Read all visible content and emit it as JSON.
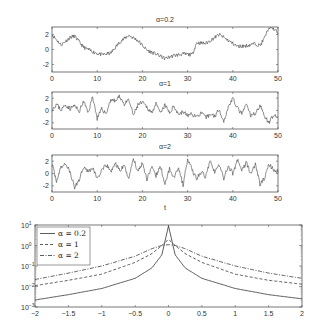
{
  "chart_data": [
    {
      "type": "line",
      "title": "α=0.2",
      "xlabel": "",
      "ylabel": "",
      "xlim": [
        0,
        50
      ],
      "ylim": [
        -3,
        3
      ],
      "xticks": [
        "0",
        "10",
        "20",
        "30",
        "40",
        "50"
      ],
      "yticks": [
        "2",
        "0",
        "-2"
      ],
      "x": [
        0,
        2,
        4,
        5,
        7,
        9,
        11,
        13,
        15,
        17,
        19,
        21,
        23,
        25,
        27,
        29,
        31,
        32,
        34,
        37,
        39,
        41,
        43,
        45,
        46,
        47,
        48,
        49,
        50
      ],
      "values": [
        2.0,
        0.6,
        1.6,
        1.8,
        0.3,
        -0.3,
        -0.7,
        -0.5,
        1.0,
        1.9,
        1.2,
        -0.1,
        -0.6,
        -1.2,
        -0.8,
        -0.6,
        -0.7,
        0.9,
        0.8,
        2.0,
        1.2,
        0.4,
        0.5,
        0.8,
        0.5,
        1.5,
        3.0,
        2.8,
        2.2
      ]
    },
    {
      "type": "line",
      "title": "α=1",
      "xlim": [
        0,
        50
      ],
      "ylim": [
        -3,
        3
      ],
      "xticks": [
        "0",
        "10",
        "20",
        "30",
        "40",
        "50"
      ],
      "yticks": [
        "2",
        "0",
        "-2"
      ],
      "x": [
        0,
        1,
        2,
        3,
        4,
        5,
        6,
        7,
        8,
        9,
        10,
        11,
        12,
        13,
        14,
        15,
        16,
        17,
        18,
        19,
        20,
        21,
        22,
        23,
        24,
        25,
        26,
        27,
        28,
        29,
        30,
        31,
        32,
        33,
        34,
        35,
        36,
        37,
        38,
        39,
        40,
        41,
        42,
        43,
        44,
        45,
        46,
        47,
        48,
        49,
        50
      ],
      "values": [
        0.2,
        1.0,
        0.1,
        0.9,
        0.3,
        0.8,
        -0.2,
        1.5,
        -0.4,
        2.3,
        -1.3,
        0.2,
        -0.5,
        1.8,
        1.5,
        2.3,
        1.0,
        1.7,
        -0.8,
        0.9,
        1.3,
        0.5,
        -0.3,
        1.0,
        -0.5,
        0.9,
        -0.4,
        0.7,
        -0.6,
        -0.2,
        -0.8,
        -0.6,
        -1.0,
        -0.4,
        -1.2,
        -0.6,
        -0.9,
        0.2,
        -1.8,
        0.6,
        2.0,
        0.4,
        -0.6,
        1.0,
        -0.9,
        -0.4,
        0.8,
        -0.8,
        -2.0,
        -0.6,
        -1.5
      ]
    },
    {
      "type": "line",
      "title": "α=2",
      "xlabel": "t",
      "xlim": [
        0,
        50
      ],
      "ylim": [
        -3,
        3
      ],
      "xticks": [
        "0",
        "10",
        "20",
        "30",
        "40",
        "50"
      ],
      "yticks": [
        "2",
        "0",
        "-2"
      ],
      "x": [
        0,
        1,
        2,
        3,
        4,
        5,
        6,
        7,
        8,
        9,
        10,
        11,
        12,
        13,
        14,
        15,
        16,
        17,
        18,
        19,
        20,
        21,
        22,
        23,
        24,
        25,
        26,
        27,
        28,
        29,
        30,
        31,
        32,
        33,
        34,
        35,
        36,
        37,
        38,
        39,
        40,
        41,
        42,
        43,
        44,
        45,
        46,
        47,
        48,
        49,
        50
      ],
      "values": [
        1.5,
        -1.2,
        1.0,
        1.6,
        0.2,
        -2.3,
        -1.0,
        1.2,
        0.3,
        0.9,
        -0.8,
        0.4,
        1.4,
        0.3,
        1.6,
        0.5,
        1.2,
        -0.8,
        2.5,
        0.3,
        1.8,
        -0.9,
        1.0,
        -0.4,
        1.2,
        -1.8,
        0.8,
        -0.6,
        1.0,
        -1.9,
        2.3,
        0.6,
        -0.9,
        0.3,
        -0.6,
        2.3,
        0.2,
        1.4,
        -0.8,
        1.2,
        0.0,
        2.2,
        0.5,
        1.8,
        -0.1,
        1.6,
        -1.8,
        -0.8,
        1.5,
        0.6,
        0.3
      ]
    },
    {
      "type": "line",
      "title": "",
      "xlabel": "",
      "ylabel": "",
      "yscale": "log",
      "xlim": [
        -2,
        2
      ],
      "ylim": [
        0.001,
        10
      ],
      "xticks": [
        "-2",
        "-1.5",
        "-1",
        "-0.5",
        "0",
        "0.5",
        "1",
        "1.5",
        "2"
      ],
      "yticks": [
        "10^1",
        "10^0",
        "10^-1",
        "10^-2",
        "10^-3"
      ],
      "legend_position": "upper left",
      "x": [
        -2,
        -1.5,
        -1,
        -0.5,
        -0.25,
        -0.1,
        0,
        0.1,
        0.25,
        0.5,
        1,
        1.5,
        2
      ],
      "series": [
        {
          "name": "α = 0.2",
          "style": "solid",
          "values": [
            0.0022,
            0.004,
            0.008,
            0.025,
            0.08,
            0.35,
            9.0,
            0.35,
            0.08,
            0.025,
            0.008,
            0.004,
            0.0025
          ]
        },
        {
          "name": "α = 1",
          "style": "dashed",
          "values": [
            0.011,
            0.02,
            0.04,
            0.15,
            0.4,
            1.0,
            2.0,
            1.0,
            0.4,
            0.15,
            0.04,
            0.02,
            0.013
          ]
        },
        {
          "name": "α = 2",
          "style": "dash-dot",
          "values": [
            0.022,
            0.045,
            0.1,
            0.3,
            0.7,
            1.0,
            1.1,
            1.0,
            0.7,
            0.3,
            0.1,
            0.045,
            0.025
          ]
        }
      ]
    }
  ],
  "panels": {
    "p1": {
      "title": "α=0.2"
    },
    "p2": {
      "title": "α=1"
    },
    "p3": {
      "title": "α=2",
      "xlabel": "t"
    },
    "p4": {
      "legend": [
        "α = 0.2",
        "α = 1",
        "α = 2"
      ],
      "xticks": [
        "-2",
        "-1.5",
        "-1",
        "-0.5",
        "0",
        "0.5",
        "1",
        "1.5",
        "2"
      ],
      "yticks": [
        "1",
        "0",
        "-1",
        "-2",
        "-3"
      ]
    },
    "ts_xticks": [
      "0",
      "10",
      "20",
      "30",
      "40",
      "50"
    ],
    "ts_yticks": [
      "2",
      "0",
      "-2"
    ]
  }
}
